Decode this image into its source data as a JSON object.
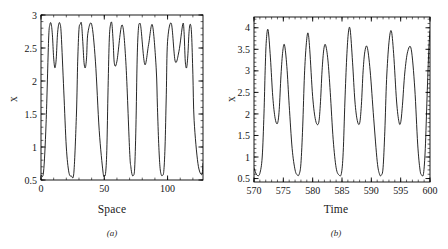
{
  "figure": {
    "background": "#ffffff",
    "line_color": "#000000",
    "axis_color": "#000000"
  },
  "panels": [
    {
      "id": "a",
      "caption": "(a)",
      "xlabel": "Space",
      "ylabel": "x"
    },
    {
      "id": "b",
      "caption": "(b)",
      "xlabel": "Time",
      "ylabel": "x"
    }
  ],
  "chart_data": [
    {
      "type": "line",
      "title": "",
      "panel": "(a)",
      "xlabel": "Space",
      "ylabel": "x",
      "xlim": [
        0,
        128
      ],
      "ylim": [
        0.5,
        3.0
      ],
      "xticks": [
        0,
        50,
        100
      ],
      "xticklabels": [
        "0",
        "50",
        "100"
      ],
      "yticks": [
        0.5,
        1,
        1.5,
        2,
        2.5,
        3
      ],
      "yticklabels": [
        "0.5",
        "1",
        "1.5",
        "2",
        "2.5",
        "3"
      ],
      "minor_xtick_interval": 10,
      "minor_ytick_interval": 0.1,
      "grid": false,
      "legend": null,
      "waveform": {
        "description": "spatially periodic standing wave with double-humped (M shaped) crests",
        "period": 21.3,
        "peak_value": 2.87,
        "mid_dip_value": 2.2,
        "trough_value": 0.56,
        "n_periods": 6,
        "phase_offset": -0.22
      },
      "series": [
        {
          "name": "x(Space)",
          "x": [
            0,
            2,
            4,
            6,
            7,
            8,
            9,
            10,
            11,
            12,
            13,
            14,
            15,
            16,
            18,
            20,
            22,
            24,
            26,
            28,
            29,
            30,
            31,
            32,
            33,
            34,
            35,
            36,
            37,
            40,
            43,
            46,
            49,
            50,
            51,
            52,
            53,
            54,
            55,
            56,
            57,
            58,
            60,
            64,
            67,
            70,
            71,
            72,
            73,
            74,
            75,
            76,
            77,
            78,
            79,
            82,
            85,
            88,
            91,
            92,
            93,
            94,
            95,
            96,
            97,
            98,
            99,
            100,
            103,
            106,
            109,
            112,
            113,
            114,
            115,
            116,
            117,
            118,
            119,
            120,
            121,
            124,
            127,
            128
          ],
          "y": [
            0.58,
            0.62,
            1.35,
            2.62,
            2.85,
            2.87,
            2.7,
            2.35,
            2.2,
            2.33,
            2.7,
            2.86,
            2.87,
            2.7,
            1.85,
            1.0,
            0.62,
            0.56,
            0.62,
            1.5,
            2.3,
            2.78,
            2.86,
            2.87,
            2.6,
            2.28,
            2.2,
            2.35,
            2.72,
            2.86,
            2.3,
            1.25,
            0.62,
            0.57,
            0.6,
            0.95,
            1.9,
            2.65,
            2.86,
            2.87,
            2.6,
            2.26,
            2.3,
            2.85,
            2.3,
            0.95,
            0.7,
            0.58,
            0.57,
            0.68,
            1.3,
            2.35,
            2.8,
            2.87,
            2.8,
            2.25,
            2.55,
            2.85,
            2.2,
            1.6,
            1.05,
            0.7,
            0.58,
            0.57,
            0.63,
            1.0,
            1.8,
            2.6,
            2.87,
            2.3,
            2.45,
            2.86,
            2.75,
            2.3,
            2.2,
            2.38,
            2.75,
            2.86,
            2.7,
            2.1,
            1.4,
            0.75,
            0.58,
            0.75
          ]
        }
      ]
    },
    {
      "type": "line",
      "title": "",
      "panel": "(b)",
      "xlabel": "Time",
      "ylabel": "x",
      "xlim": [
        570,
        600
      ],
      "ylim": [
        0.42,
        4.25
      ],
      "xticks": [
        570,
        575,
        580,
        585,
        590,
        595,
        600
      ],
      "xticklabels": [
        "570",
        "575",
        "580",
        "585",
        "590",
        "595",
        "600"
      ],
      "yticks": [
        0.5,
        1,
        1.5,
        2,
        2.5,
        3,
        3.5,
        4
      ],
      "yticklabels": [
        "0.5",
        "1",
        "1.5",
        "2",
        "2.5",
        "3",
        "3.5",
        "4"
      ],
      "minor_xtick_interval": 1,
      "minor_ytick_interval": 0.1,
      "grid": false,
      "legend": null,
      "waveform": {
        "description": "period-2 temporal oscillation, alternating tall and short peaks",
        "period": 6.6,
        "tall_peak_value": 3.95,
        "short_peak_value": 3.6,
        "mid_dip_value": 1.78,
        "trough_value": 0.57,
        "n_tall_peaks": 5
      },
      "series": [
        {
          "name": "x(Time)",
          "x": [
            570,
            570.3,
            570.6,
            571,
            571.4,
            571.7,
            571.9,
            572.1,
            572.4,
            572.8,
            573.2,
            573.6,
            574.0,
            574.3,
            574.6,
            574.9,
            575.2,
            575.6,
            576.0,
            576.5,
            577.0,
            577.4,
            577.7,
            578.0,
            578.3,
            578.6,
            578.9,
            579.2,
            579.5,
            580.0,
            580.5,
            581.0,
            581.3,
            581.6,
            581.9,
            582.2,
            582.6,
            583.0,
            583.5,
            584.0,
            584.5,
            584.9,
            585.2,
            585.5,
            585.8,
            586.1,
            586.4,
            586.8,
            587.2,
            587.6,
            588.0,
            588.3,
            588.6,
            588.9,
            589.3,
            589.8,
            590.4,
            591.0,
            591.4,
            591.7,
            592.0,
            592.3,
            592.6,
            593.0,
            593.4,
            593.8,
            594.3,
            594.7,
            595.0,
            595.3,
            595.7,
            596.2,
            596.8,
            597.4,
            597.9,
            598.3,
            598.6,
            598.9,
            599.2,
            599.5,
            599.8,
            600
          ],
          "y": [
            0.75,
            0.63,
            0.57,
            0.62,
            1.0,
            2.0,
            3.0,
            3.7,
            3.95,
            3.3,
            2.4,
            1.9,
            1.78,
            2.1,
            2.9,
            3.45,
            3.6,
            3.1,
            2.2,
            1.2,
            0.7,
            0.58,
            0.6,
            0.85,
            1.7,
            2.9,
            3.6,
            3.88,
            3.5,
            2.4,
            1.85,
            1.78,
            2.2,
            3.0,
            3.5,
            3.6,
            3.25,
            2.5,
            1.4,
            0.75,
            0.58,
            0.62,
            1.1,
            2.3,
            3.3,
            3.9,
            3.95,
            3.2,
            2.3,
            1.85,
            1.78,
            2.2,
            3.0,
            3.45,
            3.55,
            3.0,
            1.9,
            0.9,
            0.6,
            0.58,
            0.75,
            1.6,
            2.8,
            3.65,
            3.93,
            3.4,
            2.3,
            1.82,
            1.8,
            2.2,
            2.95,
            3.45,
            3.5,
            2.6,
            1.3,
            0.7,
            0.58,
            0.62,
            1.2,
            2.4,
            3.5,
            3.93
          ]
        }
      ]
    }
  ]
}
